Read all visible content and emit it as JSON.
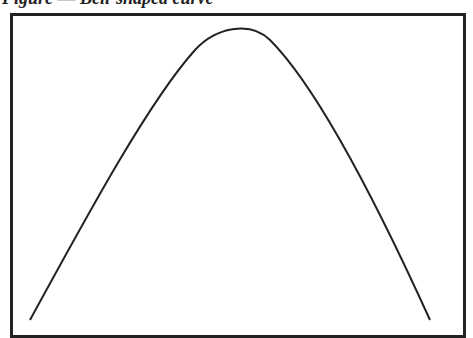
{
  "caption": "Figure — Bell-shaped curve",
  "diagram": {
    "type": "bell-curve",
    "curve_color": "#222222",
    "frame_color": "#222222",
    "points": [
      [
        30,
        320
      ],
      [
        80,
        230
      ],
      [
        130,
        140
      ],
      [
        180,
        68
      ],
      [
        233,
        27
      ],
      [
        286,
        68
      ],
      [
        336,
        140
      ],
      [
        386,
        230
      ],
      [
        430,
        320
      ]
    ]
  }
}
